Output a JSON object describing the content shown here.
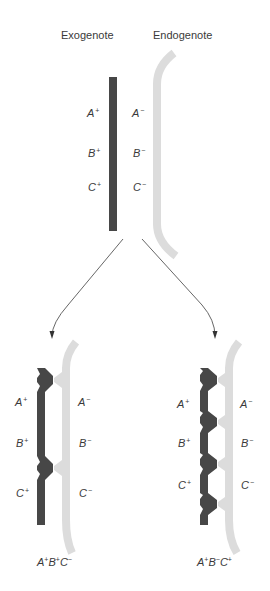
{
  "titles": {
    "exogenote": "Exogenote",
    "endogenote": "Endogenote"
  },
  "colors": {
    "exogenote_strand": "#474747",
    "endogenote_strand": "#dcdcdc",
    "arrow": "#555555",
    "text": "#3a3a3a"
  },
  "top": {
    "exo_labels": [
      {
        "gene": "A",
        "allele": "+"
      },
      {
        "gene": "B",
        "allele": "+"
      },
      {
        "gene": "C",
        "allele": "+"
      }
    ],
    "endo_labels": [
      {
        "gene": "A",
        "allele": "−"
      },
      {
        "gene": "B",
        "allele": "−"
      },
      {
        "gene": "C",
        "allele": "−"
      }
    ]
  },
  "recombinants": [
    {
      "name": "left",
      "crossovers": 2,
      "exo_labels": [
        {
          "gene": "A",
          "allele": "+"
        },
        {
          "gene": "B",
          "allele": "+"
        },
        {
          "gene": "C",
          "allele": "+"
        }
      ],
      "endo_labels": [
        {
          "gene": "A",
          "allele": "−"
        },
        {
          "gene": "B",
          "allele": "−"
        },
        {
          "gene": "C",
          "allele": "−"
        }
      ],
      "genotype": [
        {
          "gene": "A",
          "allele": "+"
        },
        {
          "gene": "B",
          "allele": "+"
        },
        {
          "gene": "C",
          "allele": "−"
        }
      ]
    },
    {
      "name": "right",
      "crossovers": 4,
      "exo_labels": [
        {
          "gene": "A",
          "allele": "+"
        },
        {
          "gene": "B",
          "allele": "+"
        },
        {
          "gene": "C",
          "allele": "+"
        }
      ],
      "endo_labels": [
        {
          "gene": "A",
          "allele": "−"
        },
        {
          "gene": "B",
          "allele": "−"
        },
        {
          "gene": "C",
          "allele": "−"
        }
      ],
      "genotype": [
        {
          "gene": "A",
          "allele": "+"
        },
        {
          "gene": "B",
          "allele": "−"
        },
        {
          "gene": "C",
          "allele": "+"
        }
      ]
    }
  ]
}
